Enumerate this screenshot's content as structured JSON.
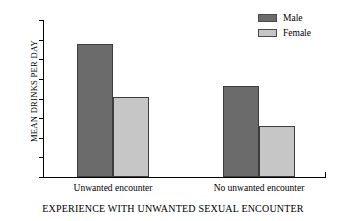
{
  "chart_data": {
    "type": "bar",
    "title": "",
    "xlabel": "EXPERIENCE WITH UNWANTED SEXUAL ENCOUNTER",
    "ylabel": "MEAN DRINKS PER DAY",
    "categories": [
      "Unwanted encounter",
      "No unwanted encounter"
    ],
    "series": [
      {
        "name": "Male",
        "values": [
          6.8,
          4.65
        ],
        "color": "#6b6b6b"
      },
      {
        "name": "Female",
        "values": [
          4.1,
          2.6
        ],
        "color": "#c6c6c6"
      }
    ],
    "ylim": [
      0,
      8
    ],
    "yticks": [
      0,
      1,
      2,
      3,
      4,
      5,
      6,
      7,
      8
    ],
    "ytick_labels": [
      "0",
      "1",
      "2",
      "3",
      "4",
      "5",
      "6",
      "7",
      "8"
    ],
    "grid": false,
    "legend_position": "top-right"
  },
  "legend": {
    "items": [
      {
        "label": "Male",
        "color": "#6b6b6b"
      },
      {
        "label": "Female",
        "color": "#c6c6c6"
      }
    ]
  }
}
